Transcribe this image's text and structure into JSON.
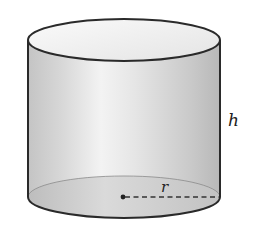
{
  "figure": {
    "shape": "cylinder",
    "labels": {
      "height": "h",
      "radius": "r"
    },
    "colors": {
      "outline": "#2a2a2a",
      "top_face": "#f2f2f2",
      "side_light": "#f4f4f4",
      "side_dark": "#bdbdbd",
      "bottom_face": "#cfcfcf"
    }
  }
}
